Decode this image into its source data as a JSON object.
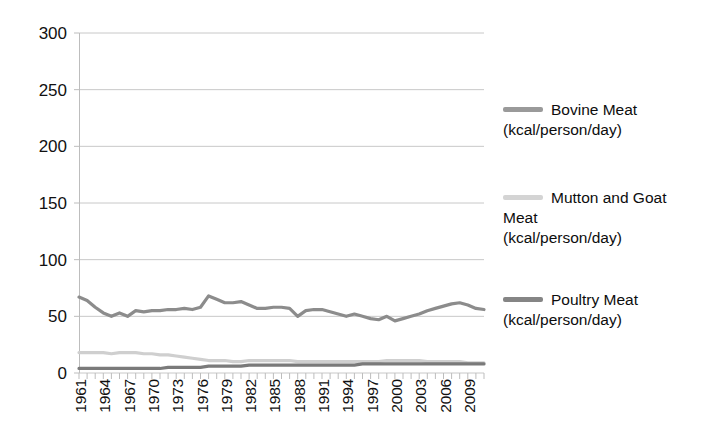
{
  "chart_data": {
    "type": "line",
    "title": "",
    "subtitle": "",
    "xlabel": "",
    "ylabel": "",
    "ylim": [
      0,
      300
    ],
    "xlim": [
      1961,
      2011
    ],
    "y_ticks": [
      0,
      50,
      100,
      150,
      200,
      250,
      300
    ],
    "y_tick_labels": [
      "0",
      "50",
      "100",
      "150",
      "200",
      "250",
      "300"
    ],
    "grid": "horizontal",
    "legend_position": "right",
    "x_tick_step": 3,
    "x_tick_labels": [
      "1961",
      "1964",
      "1967",
      "1970",
      "1973",
      "1976",
      "1979",
      "1982",
      "1985",
      "1988",
      "1991",
      "1994",
      "1997",
      "2000",
      "2003",
      "2006",
      "2009"
    ],
    "x": [
      1961,
      1962,
      1963,
      1964,
      1965,
      1966,
      1967,
      1968,
      1969,
      1970,
      1971,
      1972,
      1973,
      1974,
      1975,
      1976,
      1977,
      1978,
      1979,
      1980,
      1981,
      1982,
      1983,
      1984,
      1985,
      1986,
      1987,
      1988,
      1989,
      1990,
      1991,
      1992,
      1993,
      1994,
      1995,
      1996,
      1997,
      1998,
      1999,
      2000,
      2001,
      2002,
      2003,
      2004,
      2005,
      2006,
      2007,
      2008,
      2009,
      2010,
      2011
    ],
    "series": [
      {
        "name": "Bovine Meat (kcal/person/day)",
        "color": "#8c8c8c",
        "values": [
          67,
          64,
          58,
          53,
          50,
          53,
          50,
          55,
          54,
          55,
          55,
          56,
          56,
          57,
          56,
          58,
          68,
          65,
          62,
          62,
          63,
          60,
          57,
          57,
          58,
          58,
          57,
          50,
          55,
          56,
          56,
          54,
          52,
          50,
          52,
          50,
          48,
          47,
          50,
          46,
          48,
          50,
          52,
          55,
          57,
          59,
          61,
          62,
          60,
          57,
          56
        ]
      },
      {
        "name": "Mutton and Goat Meat (kcal/person/day)",
        "color": "#cfcfcf",
        "values": [
          18,
          18,
          18,
          18,
          17,
          18,
          18,
          18,
          17,
          17,
          16,
          16,
          15,
          14,
          13,
          12,
          11,
          11,
          11,
          10,
          10,
          11,
          11,
          11,
          11,
          11,
          11,
          10,
          10,
          10,
          10,
          10,
          10,
          10,
          10,
          10,
          10,
          10,
          11,
          11,
          11,
          11,
          11,
          10,
          10,
          10,
          10,
          10,
          9,
          9,
          9
        ]
      },
      {
        "name": "Poultry Meat (kcal/person/day)",
        "color": "#7a7a7a",
        "values": [
          4,
          4,
          4,
          4,
          4,
          4,
          4,
          4,
          4,
          4,
          4,
          5,
          5,
          5,
          5,
          5,
          6,
          6,
          6,
          6,
          6,
          7,
          7,
          7,
          7,
          7,
          7,
          7,
          7,
          7,
          7,
          7,
          7,
          7,
          7,
          8,
          8,
          8,
          8,
          8,
          8,
          8,
          8,
          8,
          8,
          8,
          8,
          8,
          8,
          8,
          8
        ]
      }
    ]
  },
  "legend": {
    "entries": [
      {
        "label": "Bovine Meat\n(kcal/person/day)",
        "color": "#9a9a9a"
      },
      {
        "label": "Mutton and Goat\nMeat\n(kcal/person/day)",
        "color": "#d4d4d4"
      },
      {
        "label": "Poultry Meat\n(kcal/person/day)",
        "color": "#858585"
      }
    ]
  },
  "colors": {
    "grid": "#c8c8c8",
    "axis": "#bdbdbd",
    "text": "#111111",
    "background": "#ffffff"
  }
}
